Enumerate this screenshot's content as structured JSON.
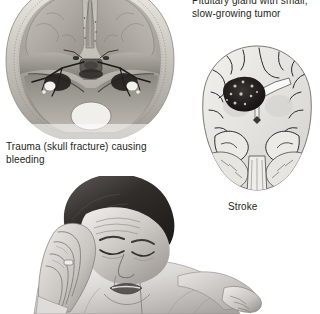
{
  "figure": {
    "background_color": "#ffffff",
    "text_color": "#231f20"
  },
  "panels": {
    "pituitary": {
      "caption": "Pituitary gland with small,\nslow-growing tumor",
      "caption_line_1": "Pituitary gland with small,",
      "caption_line_2": "slow-growing tumor",
      "note": "top line is clipped by the top edge of the image"
    },
    "trauma": {
      "caption": "Trauma (skull fracture) causing bleeding",
      "image_name": "skull-base-illustration",
      "image_alt": "Superior view of the skull base showing fracture lines and bleeding at the cranial floor"
    },
    "stroke": {
      "caption": "Stroke",
      "image_name": "brain-coronal-section-illustration",
      "image_alt": "Coronal section of the brain with a dark mottled infarct lesion in the left hemisphere basal ganglia region"
    },
    "patient": {
      "image_name": "headache-patient-photo",
      "image_alt": "Grayscale photograph of a woman with eyes closed pressing her right hand to her temple"
    }
  },
  "colors": {
    "ink": "#231f20",
    "paper": "#ffffff",
    "bone_light": "#d8d4cd",
    "bone_mid": "#a9a49c",
    "bone_dark": "#6e6a64",
    "brain_light": "#ececea",
    "brain_mid": "#cfcfcb",
    "lesion": "#1e1c1a",
    "skin_light": "#e9e7e5",
    "skin_mid": "#8d8a86",
    "hair_dark": "#2a2725"
  }
}
